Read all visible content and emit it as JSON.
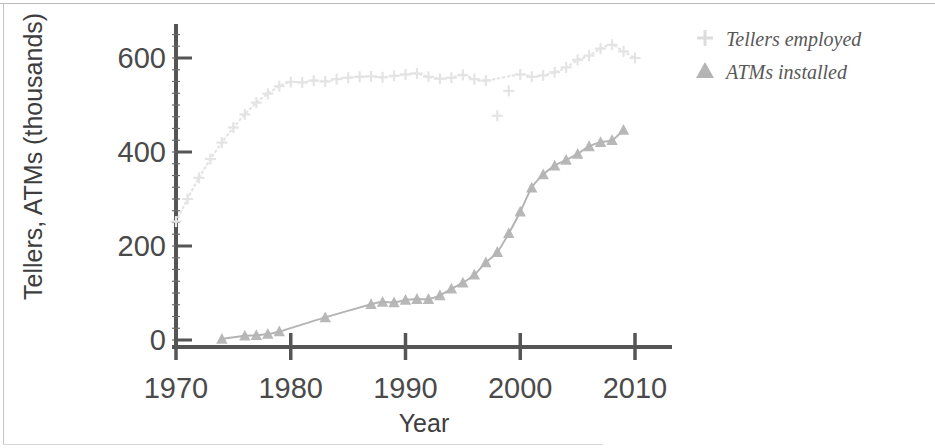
{
  "chart_data": {
    "type": "line",
    "title": "",
    "subtitle": "",
    "xlabel": "Year",
    "ylabel": "Tellers, ATMs (thousands)",
    "xlim": [
      1968,
      2014
    ],
    "ylim": [
      -20,
      690
    ],
    "xticks": [
      1970,
      1980,
      1990,
      2000,
      2010
    ],
    "xtick_labels": [
      "1970",
      "1980",
      "1990",
      "2000",
      "2010"
    ],
    "yticks": [
      0,
      200,
      400,
      600
    ],
    "ytick_labels": [
      "0",
      "200",
      "400",
      "600"
    ],
    "grid": false,
    "legend_position": "right-top",
    "series": [
      {
        "name": "Tellers employed",
        "marker": "plus",
        "color": "#e4e4e4",
        "line_style": "dotted",
        "x": [
          1970,
          1971,
          1972,
          1973,
          1974,
          1975,
          1976,
          1977,
          1978,
          1979,
          1980,
          1981,
          1982,
          1983,
          1984,
          1985,
          1986,
          1987,
          1988,
          1989,
          1990,
          1991,
          1992,
          1993,
          1994,
          1995,
          1996,
          1997,
          1998,
          1999,
          2000,
          2001,
          2002,
          2003,
          2004,
          2005,
          2006,
          2007,
          2008,
          2009,
          2010
        ],
        "y": [
          252,
          300,
          345,
          385,
          420,
          452,
          480,
          505,
          524,
          540,
          549,
          548,
          552,
          550,
          555,
          558,
          560,
          561,
          559,
          562,
          565,
          567,
          560,
          556,
          558,
          564,
          555,
          552,
          477,
          530,
          565,
          560,
          563,
          570,
          580,
          596,
          605,
          620,
          628,
          614,
          600
        ]
      },
      {
        "name": "ATMs installed",
        "marker": "triangle",
        "color": "#b4b4b4",
        "line_style": "solid",
        "x": [
          1974,
          1976,
          1977,
          1978,
          1979,
          1983,
          1987,
          1988,
          1989,
          1990,
          1991,
          1992,
          1993,
          1994,
          1995,
          1996,
          1997,
          1998,
          1999,
          2000,
          2001,
          2002,
          2003,
          2004,
          2005,
          2006,
          2007,
          2008,
          2009
        ],
        "y": [
          2,
          9,
          10,
          13,
          18,
          48,
          76,
          81,
          80,
          85,
          87,
          87,
          95,
          109,
          122,
          139,
          165,
          187,
          227,
          273,
          324,
          352,
          371,
          383,
          396,
          412,
          421,
          425,
          447
        ]
      }
    ]
  },
  "legend": {
    "items": [
      {
        "label": "Tellers employed",
        "marker": "plus-marker",
        "color": "#d9d9d9"
      },
      {
        "label": "ATMs installed",
        "marker": "triangle-marker",
        "color": "#b4b4b4"
      }
    ]
  },
  "axes": {
    "x_title": "Year",
    "y_title": "Tellers, ATMs (thousands)"
  }
}
